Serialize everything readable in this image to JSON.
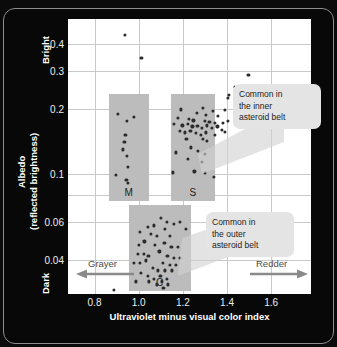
{
  "chart_data": {
    "type": "scatter",
    "title": "",
    "xlabel": "Ultraviolet minus visual color index",
    "ylabel_line1": "Albedo",
    "ylabel_line2": "(reflected brightness)",
    "y_axis_scale": "log",
    "xlim": [
      0.68,
      1.78
    ],
    "ylim": [
      0.028,
      0.52
    ],
    "xticks": [
      0.8,
      1.0,
      1.2,
      1.4,
      1.6
    ],
    "xticklabels": [
      "0.8",
      "1.0",
      "1.2",
      "1.4",
      "1.6"
    ],
    "yticks": [
      0.04,
      0.06,
      0.1,
      0.2,
      0.3,
      0.4
    ],
    "yticklabels": [
      "0.04",
      "0.06",
      "0.1",
      "0.2",
      "0.3",
      "0.4"
    ],
    "grid": true,
    "axis_end_labels": {
      "y_top": "Bright",
      "y_bottom": "Dark",
      "x_left": "Grayer",
      "x_right": "Redder"
    },
    "annotations": [
      {
        "name": "inner-belt-callout",
        "text": "Common in the inner asteroid belt",
        "lines": [
          "Common in",
          "the inner",
          "asteroid belt"
        ],
        "points_to": "S"
      },
      {
        "name": "outer-belt-callout",
        "text": "Common in the outer asteroid belt",
        "lines": [
          "Common in",
          "the outer",
          "asteroid belt"
        ],
        "points_to": "C"
      }
    ],
    "groups": [
      {
        "name": "M",
        "label": "M",
        "band": {
          "x_range": [
            0.865,
            1.045
          ],
          "y_range": [
            0.075,
            0.235
          ]
        },
        "points": [
          [
            0.905,
            0.19
          ],
          [
            0.948,
            0.176
          ],
          [
            0.978,
            0.184
          ],
          [
            0.94,
            0.152
          ],
          [
            0.935,
            0.141
          ],
          [
            0.928,
            0.13
          ],
          [
            0.945,
            0.121
          ],
          [
            0.952,
            0.108
          ],
          [
            0.898,
            0.099
          ],
          [
            0.944,
            0.094
          ],
          [
            0.95,
            0.091
          ]
        ]
      },
      {
        "name": "S",
        "label": "S",
        "band": {
          "x_range": [
            1.145,
            1.345
          ],
          "y_range": [
            0.075,
            0.235
          ]
        },
        "points": [
          [
            1.497,
            0.287
          ],
          [
            1.435,
            0.253
          ],
          [
            1.408,
            0.232
          ],
          [
            1.402,
            0.224
          ],
          [
            1.192,
            0.199
          ],
          [
            1.29,
            0.203
          ],
          [
            1.335,
            0.196
          ],
          [
            1.392,
            0.198
          ],
          [
            1.262,
            0.192
          ],
          [
            1.304,
            0.188
          ],
          [
            1.358,
            0.186
          ],
          [
            1.176,
            0.182
          ],
          [
            1.228,
            0.18
          ],
          [
            1.248,
            0.177
          ],
          [
            1.3,
            0.176
          ],
          [
            1.32,
            0.174
          ],
          [
            1.344,
            0.172
          ],
          [
            1.38,
            0.172
          ],
          [
            1.404,
            0.176
          ],
          [
            1.158,
            0.17
          ],
          [
            1.198,
            0.168
          ],
          [
            1.222,
            0.17
          ],
          [
            1.243,
            0.166
          ],
          [
            1.266,
            0.167
          ],
          [
            1.288,
            0.164
          ],
          [
            1.31,
            0.168
          ],
          [
            1.332,
            0.163
          ],
          [
            1.356,
            0.166
          ],
          [
            1.378,
            0.16
          ],
          [
            1.186,
            0.158
          ],
          [
            1.21,
            0.156
          ],
          [
            1.234,
            0.159
          ],
          [
            1.258,
            0.155
          ],
          [
            1.282,
            0.152
          ],
          [
            1.306,
            0.156
          ],
          [
            1.346,
            0.152
          ],
          [
            1.392,
            0.157
          ],
          [
            1.216,
            0.146
          ],
          [
            1.29,
            0.145
          ],
          [
            1.31,
            0.142
          ],
          [
            1.236,
            0.133
          ],
          [
            1.168,
            0.126
          ],
          [
            1.268,
            0.128
          ],
          [
            1.3,
            0.124
          ],
          [
            1.222,
            0.118
          ],
          [
            1.286,
            0.114
          ],
          [
            1.156,
            0.102
          ],
          [
            1.252,
            0.103
          ],
          [
            1.3,
            0.101
          ],
          [
            1.342,
            0.097
          ]
        ]
      },
      {
        "name": "C",
        "label": "C",
        "band": {
          "x_range": [
            0.955,
            1.235
          ],
          "y_range": [
            0.029,
            0.072
          ]
        },
        "points": [
          [
            1.1,
            0.063
          ],
          [
            1.126,
            0.06
          ],
          [
            1.16,
            0.059
          ],
          [
            1.188,
            0.06
          ],
          [
            1.04,
            0.057
          ],
          [
            1.068,
            0.058
          ],
          [
            1.12,
            0.056
          ],
          [
            1.212,
            0.056
          ],
          [
            1.004,
            0.054
          ],
          [
            1.056,
            0.053
          ],
          [
            1.084,
            0.052
          ],
          [
            1.14,
            0.052
          ],
          [
            1.026,
            0.049
          ],
          [
            1.002,
            0.047
          ],
          [
            1.072,
            0.047
          ],
          [
            1.116,
            0.048
          ],
          [
            1.148,
            0.046
          ],
          [
            1.176,
            0.046
          ],
          [
            0.998,
            0.043
          ],
          [
            1.024,
            0.043
          ],
          [
            1.044,
            0.042
          ],
          [
            1.094,
            0.044
          ],
          [
            1.13,
            0.042
          ],
          [
            1.158,
            0.041
          ],
          [
            1.186,
            0.041
          ],
          [
            0.98,
            0.039
          ],
          [
            1.006,
            0.039
          ],
          [
            1.032,
            0.04
          ],
          [
            1.11,
            0.039
          ],
          [
            1.142,
            0.038
          ],
          [
            1.168,
            0.038
          ],
          [
            1.064,
            0.037
          ],
          [
            1.088,
            0.036
          ],
          [
            1.12,
            0.036
          ],
          [
            1.15,
            0.036
          ],
          [
            1.01,
            0.035
          ],
          [
            1.04,
            0.034
          ],
          [
            1.098,
            0.034
          ],
          [
            1.128,
            0.033
          ],
          [
            1.07,
            0.033
          ],
          [
            1.046,
            0.032
          ],
          [
            1.106,
            0.032
          ],
          [
            1.134,
            0.031
          ],
          [
            1.112,
            0.03
          ],
          [
            0.986,
            0.032
          ],
          [
            1.082,
            0.031
          ],
          [
            0.886,
            0.0293
          ]
        ]
      },
      {
        "name": "outliers",
        "label": "",
        "band": null,
        "points": [
          [
            0.938,
            0.441
          ],
          [
            1.012,
            0.343
          ]
        ]
      }
    ]
  }
}
